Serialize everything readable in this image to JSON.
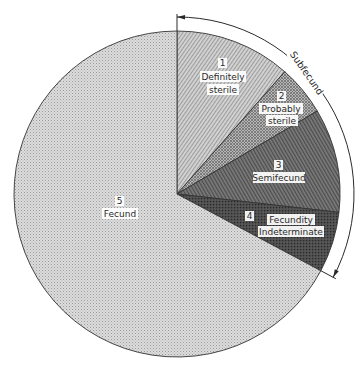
{
  "chart_data": {
    "type": "pie",
    "title": "",
    "start_angle_deg": 0,
    "direction": "clockwise",
    "slices": [
      {
        "id": 1,
        "number": "1",
        "label_lines": [
          "Definitely",
          "sterile"
        ],
        "percent": 11.5,
        "fill": "#c9c9c9",
        "pattern": "diagonal-fine"
      },
      {
        "id": 2,
        "number": "2",
        "label_lines": [
          "Probably",
          "sterile"
        ],
        "percent": 5.0,
        "fill": "#a9a9a9",
        "pattern": "crosshatch"
      },
      {
        "id": 3,
        "number": "3",
        "label_lines": [
          "Semifecund"
        ],
        "percent": 10.3,
        "fill": "#6e6e6e",
        "pattern": "diagonal-dense"
      },
      {
        "id": 4,
        "number": "4",
        "label_lines": [
          "Fecundity",
          "Indeterminate"
        ],
        "percent": 6.0,
        "fill": "#4a4a4a",
        "pattern": "dark-dense"
      },
      {
        "id": 5,
        "number": "5",
        "label_lines": [
          "Fecund"
        ],
        "percent": 67.2,
        "fill": "#d6d6d6",
        "pattern": "dot-grid"
      }
    ],
    "bracket": {
      "label": "Subfecund",
      "spans_slices": [
        1,
        2,
        3,
        4
      ],
      "percent": 32.8
    },
    "legend": "none",
    "grid": false
  },
  "labels": {
    "s1_num": "1",
    "s1_l1": "Definitely",
    "s1_l2": "sterile",
    "s2_num": "2",
    "s2_l1": "Probably",
    "s2_l2": "sterile",
    "s3_num": "3",
    "s3_l1": "Semifecund",
    "s4_num": "4",
    "s4_l1": "Fecundity",
    "s4_l2": "Indeterminate",
    "s5_num": "5",
    "s5_l1": "Fecund",
    "bracket": "Subfecund"
  }
}
